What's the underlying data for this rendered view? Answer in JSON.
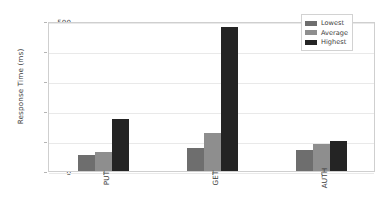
{
  "chart_data": {
    "type": "bar",
    "title": "",
    "xlabel": "",
    "ylabel": "Response Time (ms)",
    "categories": [
      "PUT",
      "GET",
      "AUTH"
    ],
    "series": [
      {
        "name": "Lowest",
        "color": "#6e6e6e",
        "values": [
          55,
          78,
          70
        ]
      },
      {
        "name": "Average",
        "color": "#8e8e8e",
        "values": [
          62,
          128,
          90
        ]
      },
      {
        "name": "Highest",
        "color": "#242424",
        "values": [
          175,
          480,
          100
        ]
      }
    ],
    "ylim": [
      0,
      500
    ],
    "yticks": [
      0,
      100,
      200,
      300,
      400,
      500
    ],
    "ytick_labels": [
      "0",
      "100",
      "200",
      "300",
      "400",
      "500"
    ],
    "grid": true,
    "legend_position": "upper right"
  }
}
